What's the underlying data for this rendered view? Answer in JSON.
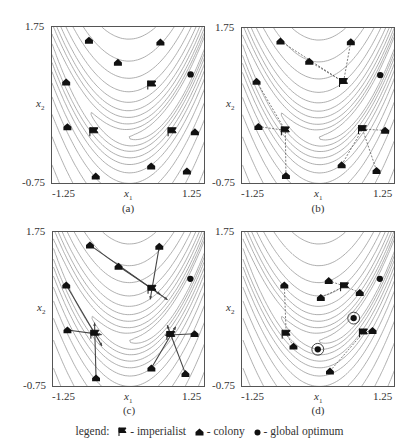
{
  "figure": {
    "x_axis": {
      "label": "x",
      "sub": "1",
      "min_label": "-1.25",
      "max_label": "1.25"
    },
    "y_axis": {
      "label": "x",
      "sub": "2",
      "min_label": "-0.75",
      "max_label": "1.75"
    },
    "panels": [
      {
        "id": "a",
        "caption": "(a)"
      },
      {
        "id": "b",
        "caption": "(b)"
      },
      {
        "id": "c",
        "caption": "(c)"
      },
      {
        "id": "d",
        "caption": "(d)"
      }
    ],
    "legend": {
      "prefix": "legend:",
      "imperialist": "- imperialist",
      "colony": "- colony",
      "optimum": "- global optimum"
    }
  },
  "colors": {
    "frame": "#555555",
    "contour": "#9a9a9a",
    "marker": "#111111",
    "arrow": "#444444"
  },
  "chart_data": {
    "type": "scatter",
    "xlabel": "x1",
    "ylabel": "x2",
    "xlim": [
      -1.25,
      1.25
    ],
    "ylim": [
      -0.75,
      1.75
    ],
    "legend": [
      "imperialist",
      "colony",
      "global optimum"
    ],
    "panels": [
      {
        "caption": "(a)",
        "colonies": [
          [
            -0.65,
            1.54
          ],
          [
            0.51,
            1.51
          ],
          [
            -0.18,
            1.19
          ],
          [
            -1.02,
            0.88
          ],
          [
            -1.0,
            0.17
          ],
          [
            0.36,
            -0.45
          ],
          [
            -0.54,
            -0.61
          ],
          [
            0.94,
            -0.53
          ],
          [
            1.07,
            0.09
          ]
        ],
        "imperialists": [
          [
            0.37,
            0.84
          ],
          [
            -0.57,
            0.1
          ],
          [
            0.7,
            0.1
          ]
        ],
        "optimum": [
          [
            1.0,
            1.0
          ]
        ]
      },
      {
        "caption": "(b)",
        "colonies": [
          [
            -0.63,
            1.54
          ],
          [
            0.52,
            1.53
          ],
          [
            -0.16,
            1.22
          ],
          [
            -1.02,
            0.9
          ],
          [
            -0.99,
            0.18
          ],
          [
            0.37,
            -0.43
          ],
          [
            -0.54,
            -0.6
          ],
          [
            0.94,
            -0.52
          ],
          [
            1.08,
            0.12
          ]
        ],
        "imperialists": [
          [
            0.4,
            0.89
          ],
          [
            -0.55,
            0.12
          ],
          [
            0.71,
            0.14
          ]
        ],
        "optimum": [
          [
            1.0,
            1.0
          ]
        ]
      },
      {
        "caption": "(c)",
        "colonies": [
          [
            -0.65,
            1.54
          ],
          [
            0.49,
            1.52
          ],
          [
            -0.18,
            1.2
          ],
          [
            -1.04,
            0.9
          ],
          [
            -1.02,
            0.18
          ],
          [
            0.36,
            -0.43
          ],
          [
            -0.55,
            -0.59
          ],
          [
            0.92,
            -0.52
          ],
          [
            1.07,
            0.12
          ]
        ],
        "imperialists": [
          [
            0.37,
            0.84
          ],
          [
            -0.57,
            0.12
          ],
          [
            0.68,
            0.1
          ]
        ],
        "optimum": [
          [
            1.0,
            1.0
          ]
        ]
      },
      {
        "caption": "(d)",
        "colonies": [
          [
            -0.57,
            0.9
          ],
          [
            0.16,
            0.97
          ],
          [
            0.03,
            0.7
          ],
          [
            0.67,
            0.78
          ],
          [
            -0.42,
            -0.08
          ],
          [
            0.18,
            -0.48
          ],
          [
            0.88,
            0.17
          ]
        ],
        "imperialists": [
          [
            0.42,
            0.88
          ],
          [
            -0.54,
            0.12
          ],
          [
            0.73,
            0.14
          ]
        ],
        "optimum": [
          [
            1.0,
            1.0
          ],
          [
            -0.02,
            -0.13
          ],
          [
            0.57,
            0.37
          ]
        ]
      }
    ]
  }
}
